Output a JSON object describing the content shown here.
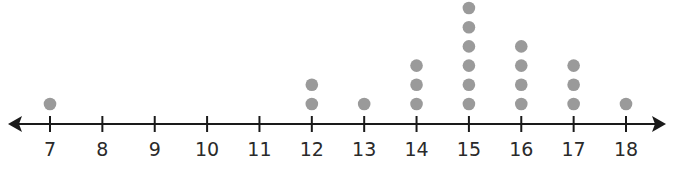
{
  "chart_data": {
    "type": "dot",
    "title": "",
    "xlabel": "",
    "ylabel": "",
    "categories": [
      7,
      8,
      9,
      10,
      11,
      12,
      13,
      14,
      15,
      16,
      17,
      18
    ],
    "values": [
      1,
      0,
      0,
      0,
      0,
      2,
      1,
      3,
      6,
      4,
      3,
      1
    ],
    "xlim": [
      7,
      18
    ],
    "arrows": "both",
    "grid": false,
    "legend": null,
    "dot_color": "#9a9a9a",
    "axis_color": "#1a1a1a"
  },
  "axis": {
    "tick_labels": [
      "7",
      "8",
      "9",
      "10",
      "11",
      "12",
      "13",
      "14",
      "15",
      "16",
      "17",
      "18"
    ]
  }
}
